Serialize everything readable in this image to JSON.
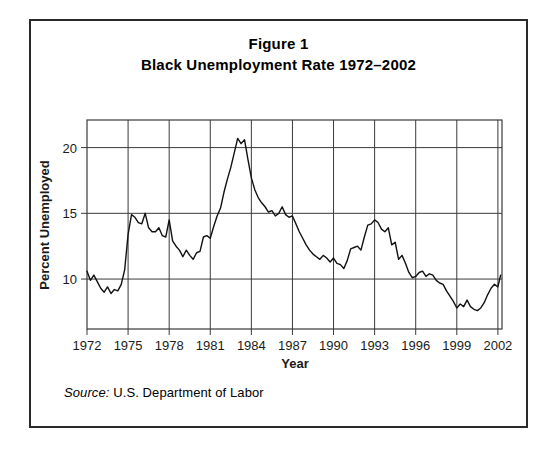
{
  "figure": {
    "title_line1": "Figure 1",
    "title_line2": "Black Unemployment Rate 1972–2002",
    "source_label": "Source:",
    "source_text": " U.S. Department of Labor",
    "frame_color": "#2a2a2a"
  },
  "chart_data": {
    "type": "line",
    "xlabel": "Year",
    "ylabel": "Percent Unemployed",
    "xlim": [
      1972,
      2002.3
    ],
    "ylim": [
      6.2,
      22.1
    ],
    "xticks": [
      1972,
      1975,
      1978,
      1981,
      1984,
      1987,
      1990,
      1993,
      1996,
      1999,
      2002
    ],
    "xticklabels": [
      "1972",
      "1975",
      "1978",
      "1981",
      "1984",
      "1987",
      "1990",
      "1993",
      "1996",
      "1999",
      "2002"
    ],
    "yticks": [
      10,
      15,
      20
    ],
    "yticklabels": [
      "10",
      "15",
      "20"
    ],
    "grid": true,
    "grid_color": "#3a3a3a",
    "line_color": "#111111",
    "line_width": 1.4,
    "legend": null,
    "series": [
      {
        "name": "Black unemployment rate",
        "units": "percent",
        "x": [
          1972.0,
          1972.25,
          1972.5,
          1972.75,
          1973.0,
          1973.25,
          1973.5,
          1973.75,
          1974.0,
          1974.25,
          1974.5,
          1974.75,
          1975.0,
          1975.25,
          1975.5,
          1975.75,
          1976.0,
          1976.25,
          1976.5,
          1976.75,
          1977.0,
          1977.25,
          1977.5,
          1977.75,
          1978.0,
          1978.25,
          1978.5,
          1978.75,
          1979.0,
          1979.25,
          1979.5,
          1979.75,
          1980.0,
          1980.25,
          1980.5,
          1980.75,
          1981.0,
          1981.25,
          1981.5,
          1981.75,
          1982.0,
          1982.25,
          1982.5,
          1982.75,
          1983.0,
          1983.25,
          1983.5,
          1983.75,
          1984.0,
          1984.25,
          1984.5,
          1984.75,
          1985.0,
          1985.25,
          1985.5,
          1985.75,
          1986.0,
          1986.25,
          1986.5,
          1986.75,
          1987.0,
          1987.25,
          1987.5,
          1987.75,
          1988.0,
          1988.25,
          1988.5,
          1988.75,
          1989.0,
          1989.25,
          1989.5,
          1989.75,
          1990.0,
          1990.25,
          1990.5,
          1990.75,
          1991.0,
          1991.25,
          1991.5,
          1991.75,
          1992.0,
          1992.25,
          1992.5,
          1992.75,
          1993.0,
          1993.25,
          1993.5,
          1993.75,
          1994.0,
          1994.25,
          1994.5,
          1994.75,
          1995.0,
          1995.25,
          1995.5,
          1995.75,
          1996.0,
          1996.25,
          1996.5,
          1996.75,
          1997.0,
          1997.25,
          1997.5,
          1997.75,
          1998.0,
          1998.25,
          1998.5,
          1998.75,
          1999.0,
          1999.25,
          1999.5,
          1999.75,
          2000.0,
          2000.25,
          2000.5,
          2000.75,
          2001.0,
          2001.25,
          2001.5,
          2001.75,
          2002.0,
          2002.2
        ],
        "y": [
          10.6,
          9.9,
          10.3,
          9.8,
          9.3,
          9.0,
          9.4,
          8.9,
          9.2,
          9.1,
          9.6,
          10.7,
          13.4,
          14.9,
          14.7,
          14.3,
          14.2,
          15.0,
          13.9,
          13.6,
          13.6,
          13.9,
          13.3,
          13.2,
          14.5,
          12.9,
          12.5,
          12.2,
          11.7,
          12.2,
          11.8,
          11.5,
          12.0,
          12.1,
          13.2,
          13.3,
          13.1,
          14.0,
          14.8,
          15.4,
          16.6,
          17.6,
          18.5,
          19.6,
          20.7,
          20.3,
          20.6,
          19.1,
          17.7,
          16.8,
          16.2,
          15.8,
          15.5,
          15.1,
          15.2,
          14.8,
          15.0,
          15.5,
          14.9,
          14.7,
          14.8,
          14.2,
          13.6,
          13.1,
          12.6,
          12.2,
          11.9,
          11.7,
          11.5,
          11.8,
          11.6,
          11.3,
          11.6,
          11.2,
          11.1,
          10.8,
          11.4,
          12.3,
          12.4,
          12.5,
          12.2,
          13.2,
          14.1,
          14.2,
          14.5,
          14.3,
          13.8,
          13.6,
          13.9,
          12.6,
          12.8,
          11.5,
          11.8,
          11.2,
          10.5,
          10.1,
          10.2,
          10.5,
          10.6,
          10.2,
          10.4,
          10.3,
          9.9,
          9.7,
          9.6,
          9.1,
          8.7,
          8.3,
          7.8,
          8.1,
          7.9,
          8.4,
          7.9,
          7.7,
          7.6,
          7.8,
          8.2,
          8.8,
          9.3,
          9.6,
          9.4,
          10.3
        ]
      }
    ],
    "annotations": []
  },
  "plot_geometry": {
    "left": 56,
    "top": 99,
    "width": 415,
    "height": 209
  }
}
